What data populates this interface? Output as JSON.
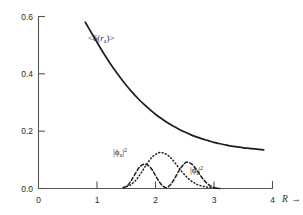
{
  "figure": {
    "background_color": "#ffffff",
    "ink_color": "#1d1d1d",
    "axis_color": "#555555"
  },
  "axes": {
    "x_axis": {
      "name": "R",
      "arrow_glyph": "→",
      "min": 0,
      "max": 4,
      "ticks": [
        0,
        1,
        2,
        3,
        4
      ],
      "tick_labels": [
        "0",
        "1",
        "2",
        "3",
        "4"
      ]
    },
    "y_axis": {
      "min": 0.0,
      "max": 0.6,
      "ticks": [
        0.0,
        0.2,
        0.4,
        0.6
      ],
      "tick_labels": [
        "0.0",
        "0.2",
        "0.4",
        "0.6"
      ]
    },
    "grid": false,
    "frame": "left-and-bottom-spines"
  },
  "labels": {
    "expectation": {
      "prefix": "<",
      "delta": "δ",
      "open_paren": "(",
      "r_symbol": "r",
      "r_subscript": "a",
      "close_paren": ")",
      "suffix": ">",
      "plain": "<δ(r_a)>"
    },
    "phi_a": {
      "bar_left": "|",
      "phi": "ϕ",
      "subscript": "a",
      "bar_right": "|",
      "exponent": "2",
      "plain": "|ϕ_a|²"
    },
    "phi_i": {
      "bar_left": "|",
      "phi": "ϕ",
      "subscript": "i",
      "bar_right": "|",
      "exponent": "2",
      "plain": "|ϕ_i|²"
    }
  },
  "chart_data": {
    "type": "line",
    "title": "",
    "xlabel": "R",
    "ylabel": "",
    "xlim": [
      0,
      4
    ],
    "ylim": [
      0.0,
      0.6
    ],
    "xticks": [
      0,
      1,
      2,
      3,
      4
    ],
    "yticks": [
      0.0,
      0.2,
      0.4,
      0.6
    ],
    "grid": false,
    "legend_position": "inline-annotations",
    "series": [
      {
        "name": "<δ(r_a)>",
        "style": "solid",
        "annotation_label": "<δ(r_a)>",
        "annotation_at": [
          1.35,
          0.52
        ],
        "x": [
          0.8,
          0.9,
          1.0,
          1.1,
          1.2,
          1.3,
          1.4,
          1.5,
          1.6,
          1.7,
          1.8,
          1.9,
          2.0,
          2.1,
          2.2,
          2.3,
          2.4,
          2.5,
          2.6,
          2.7,
          2.8,
          2.9,
          3.0,
          3.1,
          3.2,
          3.3,
          3.4,
          3.5,
          3.6,
          3.7,
          3.85
        ],
        "y": [
          0.58,
          0.545,
          0.51,
          0.476,
          0.444,
          0.414,
          0.386,
          0.36,
          0.336,
          0.314,
          0.294,
          0.276,
          0.259,
          0.244,
          0.23,
          0.218,
          0.207,
          0.197,
          0.188,
          0.18,
          0.173,
          0.167,
          0.161,
          0.156,
          0.152,
          0.148,
          0.145,
          0.142,
          0.14,
          0.138,
          0.135
        ]
      },
      {
        "name": "|ϕ_a|²",
        "style": "dotted",
        "annotation_label": "|ϕ_a|²",
        "annotation_at": [
          1.72,
          0.175
        ],
        "peak_x": 2.1,
        "peak_y": 0.125,
        "x": [
          1.45,
          1.55,
          1.65,
          1.75,
          1.85,
          1.95,
          2.05,
          2.1,
          2.15,
          2.25,
          2.35,
          2.45,
          2.55,
          2.65,
          2.75,
          2.85,
          2.95,
          3.05,
          3.1
        ],
        "y": [
          0.004,
          0.01,
          0.026,
          0.053,
          0.085,
          0.111,
          0.124,
          0.125,
          0.123,
          0.109,
          0.085,
          0.059,
          0.037,
          0.021,
          0.011,
          0.006,
          0.003,
          0.001,
          0.0
        ]
      },
      {
        "name": "|ϕ_i|²",
        "style": "dashed",
        "annotation_label": "|ϕ_i|²",
        "annotation_at": [
          2.82,
          0.072
        ],
        "peaks": [
          {
            "x": 1.8,
            "y": 0.085
          },
          {
            "x": 2.55,
            "y": 0.092
          }
        ],
        "trough": {
          "x": 2.18,
          "y": 0.004
        },
        "x": [
          1.45,
          1.52,
          1.58,
          1.65,
          1.72,
          1.8,
          1.88,
          1.95,
          2.02,
          2.1,
          2.18,
          2.26,
          2.34,
          2.42,
          2.5,
          2.55,
          2.62,
          2.7,
          2.78,
          2.86,
          2.94,
          3.02,
          3.1
        ],
        "y": [
          0.002,
          0.01,
          0.026,
          0.05,
          0.073,
          0.085,
          0.08,
          0.063,
          0.038,
          0.014,
          0.003,
          0.014,
          0.04,
          0.068,
          0.088,
          0.092,
          0.085,
          0.066,
          0.042,
          0.022,
          0.009,
          0.002,
          0.0
        ]
      }
    ]
  }
}
